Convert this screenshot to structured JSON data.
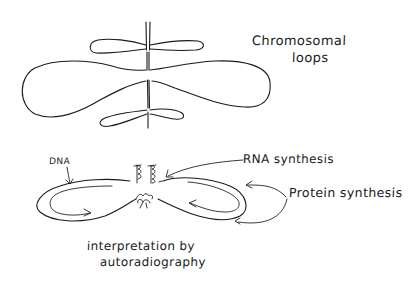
{
  "figure": {
    "background": "#ffffff",
    "ink_color": "#1a1a1a",
    "top_panel": {
      "title_line1": "Chromosomal",
      "title_line2": "loops"
    },
    "bottom_panel": {
      "labels": {
        "dna": "DNA",
        "rna_synthesis": "RNA synthesis",
        "protein_synthesis": "Protein synthesis"
      },
      "caption_line1": "interpretation by",
      "caption_line2": "autoradiography"
    }
  }
}
